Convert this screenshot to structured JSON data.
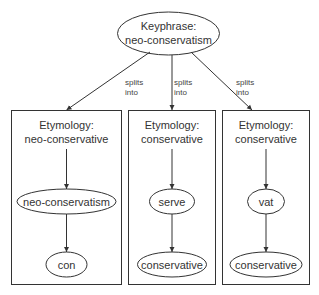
{
  "colors": {
    "stroke": "#333333",
    "text": "#333333",
    "background": "#ffffff"
  },
  "root": {
    "line1": "Keyphrase:",
    "line2": "neo-conservatism"
  },
  "edge_label": {
    "line1": "splits",
    "line2": "into"
  },
  "edges_from_root": [
    {
      "label_line1": "splits",
      "label_line2": "into"
    },
    {
      "label_line1": "splits",
      "label_line2": "into"
    },
    {
      "label_line1": "splits",
      "label_line2": "into"
    }
  ],
  "groups": [
    {
      "title_line1": "Etymology:",
      "title_line2": "neo-conservative",
      "nodes": [
        "neo-conservatism",
        "con"
      ]
    },
    {
      "title_line1": "Etymology:",
      "title_line2": "conservative",
      "nodes": [
        "serve",
        "conservative"
      ]
    },
    {
      "title_line1": "Etymology:",
      "title_line2": "conservative",
      "nodes": [
        "vat",
        "conservative"
      ]
    }
  ]
}
